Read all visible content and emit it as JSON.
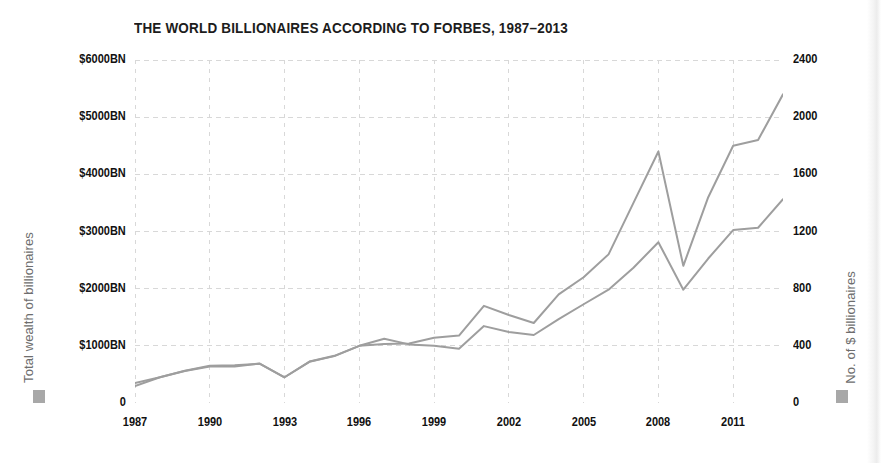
{
  "chart_data": {
    "type": "line",
    "title": "THE WORLD BILLIONAIRES ACCORDING TO FORBES, 1987–2013",
    "xlabel": "",
    "ylabel": "Total wealth of billionaires",
    "ylabel_right": "No. of $ billionaires",
    "grid": true,
    "legend_position": "none",
    "x": [
      1987,
      1988,
      1989,
      1990,
      1991,
      1992,
      1993,
      1994,
      1995,
      1996,
      1997,
      1998,
      1999,
      2000,
      2001,
      2002,
      2003,
      2004,
      2005,
      2006,
      2007,
      2008,
      2009,
      2010,
      2011,
      2012,
      2013
    ],
    "xlim": [
      1987,
      2013
    ],
    "ylim": [
      0,
      6000
    ],
    "ylim_right": [
      0,
      2400
    ],
    "yticks": [
      0,
      1000,
      2000,
      3000,
      4000,
      5000,
      6000
    ],
    "ytick_labels": [
      "0",
      "$1000BN",
      "$2000BN",
      "$3000BN",
      "$4000BN",
      "$5000BN",
      "$6000BN"
    ],
    "yticks_right": [
      0,
      400,
      800,
      1200,
      1600,
      2000,
      2400
    ],
    "ytick_labels_right": [
      "0",
      "400",
      "800",
      "1200",
      "1600",
      "2000",
      "2400"
    ],
    "xticks": [
      1987,
      1990,
      1993,
      1996,
      1999,
      2002,
      2005,
      2008,
      2011
    ],
    "xtick_labels": [
      "1987",
      "1990",
      "1993",
      "1996",
      "1999",
      "2002",
      "2005",
      "2008",
      "2011"
    ],
    "line_color": "#9e9e9e",
    "grid_color": "#d8d8d8",
    "series": [
      {
        "name": "Total wealth of billionaires",
        "axis": "left",
        "unit": "$BN",
        "values": [
          295,
          450,
          560,
          640,
          640,
          690,
          450,
          720,
          820,
          1000,
          1030,
          1040,
          1140,
          1180,
          1700,
          1540,
          1400,
          1900,
          2200,
          2600,
          3500,
          4400,
          2400,
          3600,
          4500,
          4600,
          5400
        ]
      },
      {
        "name": "No. of $ billionaires",
        "axis": "right",
        "unit": "count",
        "values": [
          140,
          180,
          225,
          260,
          265,
          275,
          180,
          290,
          330,
          400,
          450,
          410,
          400,
          380,
          538,
          497,
          476,
          587,
          691,
          793,
          946,
          1125,
          793,
          1011,
          1210,
          1226,
          1426
        ]
      }
    ]
  },
  "legend": {
    "left_swatch_color": "#a8a8a8",
    "right_swatch_color": "#a8a8a8"
  }
}
